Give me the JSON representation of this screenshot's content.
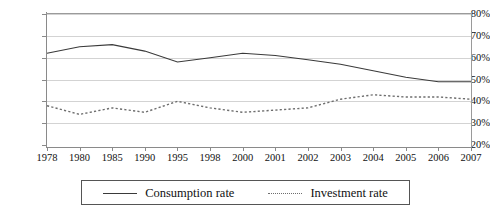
{
  "chart_data": {
    "type": "line",
    "title": "",
    "xlabel": "",
    "ylabel": "",
    "categories": [
      "1978",
      "1980",
      "1985",
      "1990",
      "1995",
      "1998",
      "2000",
      "2001",
      "2002",
      "2003",
      "2004",
      "2005",
      "2006",
      "2007"
    ],
    "ylim": [
      20,
      80
    ],
    "ytick_labels": [
      "80%",
      "70%",
      "60%",
      "50%",
      "40%",
      "30%",
      "20%"
    ],
    "ytick_values": [
      80,
      70,
      60,
      50,
      40,
      30,
      20
    ],
    "grid": true,
    "legend_position": "bottom",
    "series": [
      {
        "name": "Consumption rate",
        "style": "solid",
        "color": "#3a3a3a",
        "values": [
          62,
          65,
          66,
          63,
          58,
          60,
          62,
          61,
          59,
          57,
          54,
          51,
          49,
          49
        ]
      },
      {
        "name": "Investment rate",
        "style": "dotted",
        "color": "#6e6e6e",
        "values": [
          38,
          34,
          37,
          35,
          40,
          37,
          35,
          36,
          37,
          41,
          43,
          42,
          42,
          41
        ]
      }
    ]
  },
  "legend": {
    "items": [
      {
        "label": "Consumption rate"
      },
      {
        "label": "Investment rate"
      }
    ]
  }
}
